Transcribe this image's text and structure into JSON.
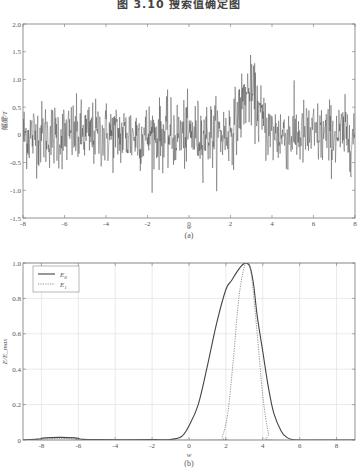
{
  "figure": {
    "title": "图 3.10  搜索值确定图"
  },
  "chart_data": [
    {
      "id": "a",
      "type": "line",
      "title": "",
      "caption": "(a)",
      "xlabel": "w",
      "ylabel": "幅度/T",
      "xlim": [
        -8,
        8
      ],
      "ylim": [
        -1.5,
        2.0
      ],
      "xticks": [
        -8,
        -6,
        -4,
        -2,
        0,
        2,
        4,
        6,
        8
      ],
      "xtick_labels": [
        "-8",
        "-6",
        "-4",
        "-2",
        "0",
        "2",
        "4",
        "6",
        "8"
      ],
      "yticks": [
        -1.5,
        -1.0,
        -0.5,
        0,
        0.5,
        1.0,
        1.5,
        2.0
      ],
      "ytick_labels": [
        "-1.5",
        "-1.0",
        "-0.5",
        "0",
        "0.5",
        "1.0",
        "1.5",
        "2.0"
      ],
      "grid": false,
      "series": [
        {
          "name": "noisy signal",
          "style": "solid",
          "color": "#333333",
          "description": "dense noise around 0 (std ~0.3) with a raised bump centered near w=3 peaking ~0.7 mean, spikes up to ~1.85",
          "baseline_mean": 0.0,
          "noise_std": 0.3,
          "bump": {
            "center": 2.9,
            "width": 0.6,
            "height": 0.75
          }
        }
      ]
    },
    {
      "id": "b",
      "type": "line",
      "title": "",
      "caption": "(b)",
      "xlabel": "w",
      "ylabel": "E/E_max",
      "xlim": [
        -9,
        9
      ],
      "ylim": [
        0,
        1.0
      ],
      "xticks": [
        -8,
        -6,
        -4,
        -2,
        0,
        2,
        4,
        6,
        8
      ],
      "xtick_labels": [
        "-8",
        "-6",
        "-4",
        "-2",
        "0",
        "2",
        "4",
        "6",
        "8"
      ],
      "yticks": [
        0,
        0.2,
        0.4,
        0.6,
        0.8,
        1.0
      ],
      "ytick_labels": [
        "0",
        "0.2",
        "0.4",
        "0.6",
        "0.8",
        "1.0"
      ],
      "grid": true,
      "legend": {
        "position": "upper left",
        "entries": [
          "E0",
          "E1"
        ]
      },
      "series": [
        {
          "name": "E0",
          "style": "solid",
          "color": "#444444",
          "x": [
            -9,
            -8.2,
            -7.8,
            -7.0,
            -6.2,
            -5.8,
            -5,
            -2,
            -1,
            -0.4,
            0,
            0.5,
            1.0,
            1.5,
            2.0,
            2.3,
            2.6,
            2.9,
            3.1,
            3.3,
            3.5,
            3.7,
            4.0,
            4.3,
            4.6,
            5.0,
            5.3,
            5.6,
            6,
            9
          ],
          "y": [
            0.0,
            0.005,
            0.012,
            0.015,
            0.012,
            0.004,
            0.002,
            0.002,
            0.003,
            0.02,
            0.08,
            0.2,
            0.42,
            0.66,
            0.85,
            0.9,
            0.95,
            0.99,
            1.0,
            0.98,
            0.88,
            0.7,
            0.5,
            0.3,
            0.15,
            0.05,
            0.015,
            0.003,
            0.0,
            0.0
          ]
        },
        {
          "name": "E1",
          "style": "dotted",
          "color": "#777777",
          "x": [
            -9,
            -8.0,
            -7.5,
            -7.0,
            -6.5,
            -6.0,
            -5.5,
            1.5,
            1.8,
            2.1,
            2.4,
            2.7,
            3.0,
            3.2,
            3.4,
            3.7,
            4.0,
            4.3,
            4.5,
            9
          ],
          "y": [
            0.0,
            0.005,
            0.008,
            0.008,
            0.008,
            0.005,
            0.0,
            0.0,
            0.02,
            0.15,
            0.45,
            0.8,
            0.98,
            1.0,
            0.92,
            0.6,
            0.25,
            0.04,
            0.0,
            0.0
          ]
        }
      ]
    }
  ]
}
